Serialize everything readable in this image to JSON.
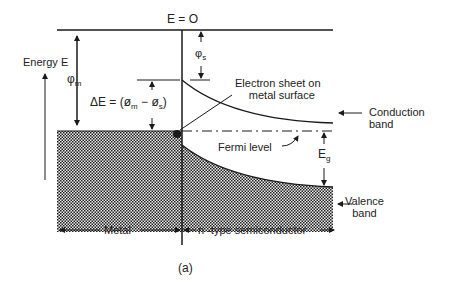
{
  "diagram": {
    "caption": "(a)",
    "vacuum_level": "E = O",
    "energy_axis": "Energy E",
    "phi_m": {
      "sym": "φ",
      "sub": "m"
    },
    "phi_s": {
      "sym": "φ",
      "sub": "s"
    },
    "delta_e": {
      "prefix": "ΔE = (",
      "a": "ø",
      "a_sub": "m",
      "mid": " − ",
      "b": "ø",
      "b_sub": "s",
      "suffix": ")"
    },
    "electron_sheet": [
      "Electron sheet on",
      "metal surface"
    ],
    "conduction_band": [
      "Conduction",
      "band"
    ],
    "fermi_level": "Fermi level",
    "eg": {
      "sym": "E",
      "sub": "g"
    },
    "valence_band": [
      "Valence",
      "band"
    ],
    "metal": "Metal",
    "semiconductor": "n -type semiconductor",
    "colors": {
      "ink": "#1a1a1a",
      "hatch": "#2a2a2a",
      "background": "#ffffff"
    }
  }
}
